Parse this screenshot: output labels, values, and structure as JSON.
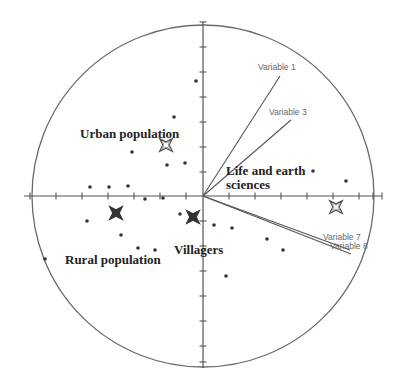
{
  "chart_data": {
    "type": "scatter",
    "subtype": "PCA biplot / correlation circle",
    "title": "",
    "xlabel": "",
    "ylabel": "",
    "grid": false,
    "legend": null,
    "origin_px": [
      203,
      196
    ],
    "circle_radius_px": 171,
    "axes": {
      "horizontal": {
        "x1": 24,
        "x2": 382,
        "y": 196,
        "ticks_x": [
          30,
          56,
          82,
          108,
          134,
          160,
          186,
          229,
          255,
          281,
          307,
          333,
          359,
          373,
          382
        ]
      },
      "vertical": {
        "y1": 22,
        "y2": 368,
        "x": 203,
        "ticks_y": [
          22,
          47,
          72,
          97,
          122,
          147,
          172,
          221,
          246,
          271,
          296,
          321,
          346,
          362
        ]
      }
    },
    "variables": [
      {
        "name": "Variable 1",
        "end_px": [
          280,
          76
        ],
        "label_px": [
          258,
          70
        ]
      },
      {
        "name": "Variable 3",
        "end_px": [
          291,
          120
        ],
        "label_px": [
          269,
          115
        ]
      },
      {
        "name": "Variable 7",
        "end_px": [
          350,
          250
        ],
        "label_px": [
          323,
          240
        ]
      },
      {
        "name": "Variable 8",
        "end_px": [
          351,
          254
        ],
        "label_px": [
          330,
          249
        ]
      }
    ],
    "group_labels": [
      {
        "text": "Urban population",
        "px": [
          80,
          138
        ]
      },
      {
        "text": "Life and earth",
        "px": [
          226,
          175
        ]
      },
      {
        "text": "sciences",
        "px": [
          226,
          189
        ]
      },
      {
        "text": "Villagers",
        "px": [
          174,
          254
        ]
      },
      {
        "text": "Rural population",
        "px": [
          65,
          264
        ]
      }
    ],
    "centroids": [
      {
        "group": "Urban population",
        "px": [
          166,
          145
        ],
        "style": "hollow"
      },
      {
        "group": "Rural population",
        "px": [
          116,
          213
        ],
        "style": "filled"
      },
      {
        "group": "Villagers",
        "px": [
          193,
          217
        ],
        "style": "filled"
      },
      {
        "group": "Life and earth sciences",
        "px": [
          336,
          207
        ],
        "style": "hollow"
      }
    ],
    "points_px": [
      [
        196,
        81
      ],
      [
        174,
        117
      ],
      [
        132,
        152
      ],
      [
        167,
        165
      ],
      [
        185,
        163
      ],
      [
        90,
        187
      ],
      [
        109,
        187
      ],
      [
        128,
        186
      ],
      [
        145,
        199
      ],
      [
        163,
        198
      ],
      [
        87,
        221
      ],
      [
        121,
        235
      ],
      [
        138,
        248
      ],
      [
        155,
        250
      ],
      [
        45,
        259
      ],
      [
        180,
        214
      ],
      [
        214,
        225
      ],
      [
        232,
        228
      ],
      [
        267,
        239
      ],
      [
        283,
        250
      ],
      [
        226,
        276
      ],
      [
        313,
        171
      ],
      [
        346,
        181
      ]
    ]
  }
}
